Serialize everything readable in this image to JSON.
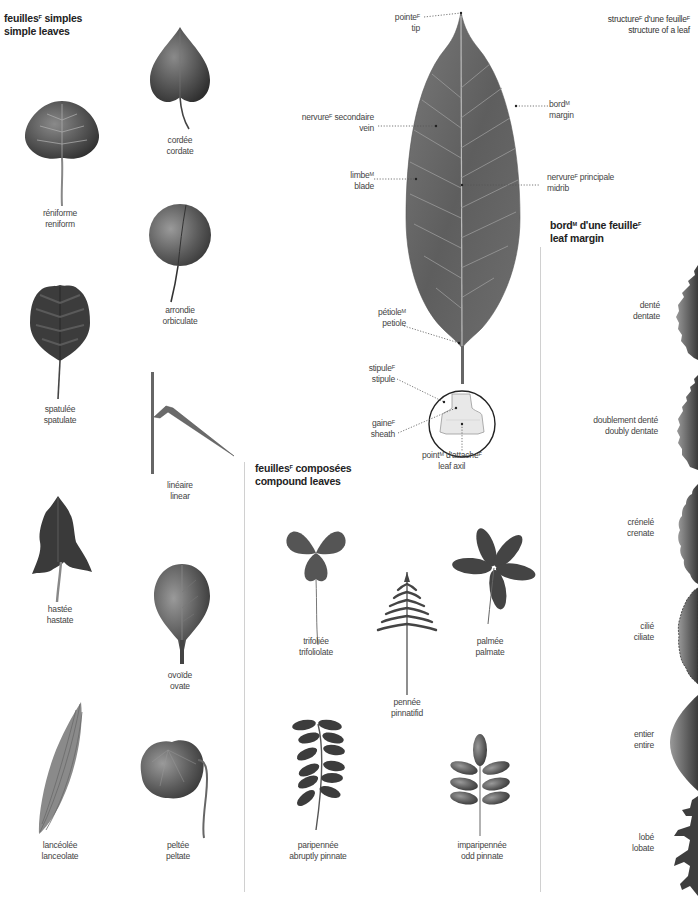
{
  "sections": {
    "simple": {
      "title_fr": "feuilles",
      "title_fr_sup": "F",
      "title_fr_rest": " simples",
      "title_en": "simple leaves"
    },
    "compound": {
      "title_fr": "feuilles",
      "title_fr_sup": "F",
      "title_fr_rest": " composées",
      "title_en": "compound leaves"
    },
    "structure": {
      "title_fr_a": "structure",
      "sup_a": "F",
      "title_fr_b": " d'une feuille",
      "sup_b": "F",
      "title_en": "structure of a leaf"
    },
    "margin": {
      "title_fr_a": "bord",
      "sup_a": "M",
      "title_fr_b": " d'une feuille",
      "sup_b": "F",
      "title_en": "leaf margin"
    }
  },
  "simple_leaves": [
    {
      "fr": "réniforme",
      "en": "reniform"
    },
    {
      "fr": "cordée",
      "en": "cordate"
    },
    {
      "fr": "arrondie",
      "en": "orbiculate"
    },
    {
      "fr": "spatulée",
      "en": "spatulate"
    },
    {
      "fr": "linéaire",
      "en": "linear"
    },
    {
      "fr": "hastée",
      "en": "hastate"
    },
    {
      "fr": "ovoïde",
      "en": "ovate"
    },
    {
      "fr": "lancéolée",
      "en": "lanceolate"
    },
    {
      "fr": "peltée",
      "en": "peltate"
    }
  ],
  "compound_leaves": [
    {
      "fr": "trifoliée",
      "en": "trifoliolate"
    },
    {
      "fr": "palmée",
      "en": "palmate"
    },
    {
      "fr": "pennée",
      "en": "pinnatifid"
    },
    {
      "fr": "paripennée",
      "en": "abruptly pinnate"
    },
    {
      "fr": "imparipennée",
      "en": "odd pinnate"
    }
  ],
  "structure_parts": [
    {
      "fr": "pointe",
      "sup": "F",
      "en": "tip"
    },
    {
      "fr": "nervure",
      "sup": "F",
      "fr_rest": " secondaire",
      "en": "vein"
    },
    {
      "fr": "bord",
      "sup": "M",
      "en": "margin"
    },
    {
      "fr": "limbe",
      "sup": "M",
      "en": "blade"
    },
    {
      "fr": "nervure",
      "sup": "F",
      "fr_rest": " principale",
      "en": "midrib"
    },
    {
      "fr": "pétiole",
      "sup": "M",
      "en": "petiole"
    },
    {
      "fr": "stipule",
      "sup": "F",
      "en": "stipule"
    },
    {
      "fr": "gaine",
      "sup": "F",
      "en": "sheath"
    },
    {
      "fr": "point",
      "sup": "M",
      "fr_rest": " d'attache",
      "sup2": "F",
      "en": "leaf axil"
    }
  ],
  "margins": [
    {
      "fr": "denté",
      "en": "dentate"
    },
    {
      "fr": "doublement denté",
      "en": "doubly dentate"
    },
    {
      "fr": "crénelé",
      "en": "crenate"
    },
    {
      "fr": "cilié",
      "en": "ciliate"
    },
    {
      "fr": "entier",
      "en": "entire"
    },
    {
      "fr": "lobé",
      "en": "lobate"
    }
  ],
  "colors": {
    "leaf_dark": "#3a3a3a",
    "leaf_mid": "#5a5a5a",
    "leaf_light": "#8a8a8a",
    "divider": "#d0d0d0",
    "text": "#444444"
  }
}
